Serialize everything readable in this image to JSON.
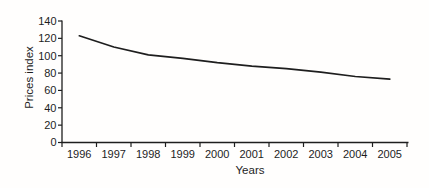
{
  "chart_data": {
    "type": "line",
    "title": "",
    "xlabel": "Years",
    "ylabel": "Prices index",
    "categories": [
      "1996",
      "1997",
      "1998",
      "1999",
      "2000",
      "2001",
      "2002",
      "2003",
      "2004",
      "2005"
    ],
    "series": [
      {
        "name": "Prices index",
        "values": [
          123,
          110,
          101,
          97,
          92,
          88,
          85,
          81,
          76,
          73
        ]
      }
    ],
    "ylim": [
      0,
      140
    ],
    "ytick_step": 20,
    "yticks": [
      0,
      20,
      40,
      60,
      80,
      100,
      120,
      140
    ],
    "grid": false,
    "legend_position": "none",
    "line_color": "#1e1e1e",
    "axis_color": "#1e1e1e",
    "text_color": "#1d1d1d",
    "background_color": "#fffefd"
  }
}
